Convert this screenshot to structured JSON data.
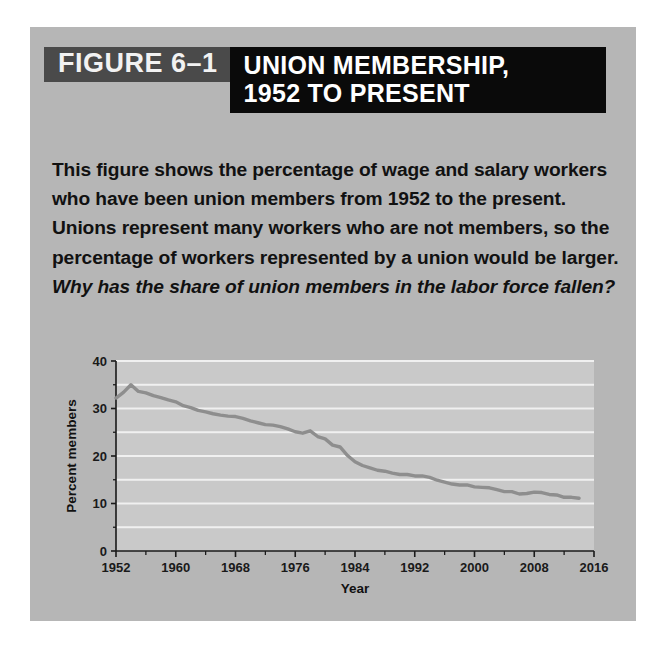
{
  "figure": {
    "number_label": "FIGURE 6–1",
    "title": "UNION MEMBERSHIP,\n1952 TO PRESENT",
    "caption_main": "This figure shows the percentage of wage and salary workers who have been union members from 1952 to the present. Unions represent many workers who are not members, so the percentage of workers represented by a union would be larger. ",
    "caption_question": "Why has the share of union members in the labor force fallen?"
  },
  "colors": {
    "card_background": "#b6b6b6",
    "number_box": "#4a4a4a",
    "title_box": "#0a0a0a",
    "plot_background": "#c9c9c9",
    "gridline": "#f0f0f0",
    "line_series": "#8e8e8e",
    "axis": "#1a1a1a",
    "text": "#111111"
  },
  "chart_data": {
    "type": "line",
    "title": "",
    "xlabel": "Year",
    "ylabel": "Percent members",
    "xlim": [
      1952,
      2016
    ],
    "ylim": [
      0,
      40
    ],
    "grid": true,
    "legend": "none",
    "y_ticks": [
      0,
      10,
      20,
      30,
      40
    ],
    "y_tick_labels": [
      "0",
      "10",
      "20",
      "30",
      "40"
    ],
    "y_minor_ticks": [
      5,
      15,
      25,
      35
    ],
    "x_ticks": [
      1952,
      1960,
      1968,
      1976,
      1984,
      1992,
      2000,
      2008,
      2016
    ],
    "x_tick_labels": [
      "1952",
      "1960",
      "1968",
      "1976",
      "1984",
      "1992",
      "2000",
      "2008",
      "2016"
    ],
    "x_minor_ticks": [
      1956,
      1964,
      1972,
      1980,
      1988,
      1996,
      2004,
      2012
    ],
    "series": [
      {
        "name": "Union members as percent of wage and salary workers",
        "x": [
          1952,
          1953,
          1954,
          1955,
          1956,
          1957,
          1958,
          1959,
          1960,
          1961,
          1962,
          1963,
          1964,
          1965,
          1966,
          1967,
          1968,
          1969,
          1970,
          1971,
          1972,
          1973,
          1974,
          1975,
          1976,
          1977,
          1978,
          1979,
          1980,
          1981,
          1982,
          1983,
          1984,
          1985,
          1986,
          1987,
          1988,
          1989,
          1990,
          1991,
          1992,
          1993,
          1994,
          1995,
          1996,
          1997,
          1998,
          1999,
          2000,
          2001,
          2002,
          2003,
          2004,
          2005,
          2006,
          2007,
          2008,
          2009,
          2010,
          2011,
          2012,
          2013,
          2014
        ],
        "values": [
          32.2,
          33.4,
          35.0,
          33.6,
          33.3,
          32.7,
          32.3,
          31.8,
          31.4,
          30.6,
          30.2,
          29.6,
          29.3,
          28.9,
          28.6,
          28.4,
          28.3,
          27.9,
          27.4,
          27.0,
          26.6,
          26.5,
          26.2,
          25.7,
          25.1,
          24.8,
          25.3,
          24.1,
          23.6,
          22.3,
          21.9,
          20.1,
          18.8,
          18.0,
          17.5,
          17.0,
          16.8,
          16.4,
          16.1,
          16.1,
          15.8,
          15.8,
          15.5,
          14.9,
          14.5,
          14.1,
          13.9,
          13.9,
          13.5,
          13.4,
          13.3,
          12.9,
          12.5,
          12.5,
          12.0,
          12.1,
          12.4,
          12.3,
          11.9,
          11.8,
          11.3,
          11.3,
          11.1
        ]
      }
    ]
  }
}
